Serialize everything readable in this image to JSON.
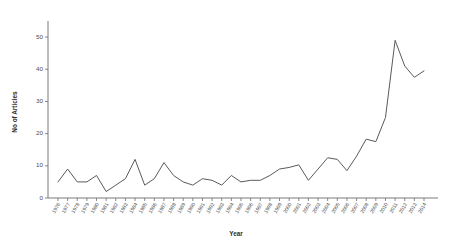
{
  "chart_data": {
    "type": "line",
    "title": "",
    "xlabel": "Year",
    "ylabel": "No of Articles",
    "ylim": [
      0,
      55
    ],
    "yticks": [
      0,
      10,
      20,
      30,
      40,
      50
    ],
    "grid": false,
    "legend": "none",
    "categories": [
      "1976",
      "1977",
      "1978",
      "1979",
      "1980",
      "1981",
      "1982",
      "1983",
      "1984",
      "1985",
      "1986",
      "1987",
      "1988",
      "1989",
      "1990",
      "1991",
      "1992",
      "1993",
      "1994",
      "1995",
      "1996",
      "1997",
      "1998",
      "1999",
      "2000",
      "2001",
      "2002",
      "2003",
      "2004",
      "2005",
      "2006",
      "2007",
      "2008",
      "2009",
      "2010",
      "2011",
      "2012",
      "2013",
      "2014"
    ],
    "series": [
      {
        "name": "No of Articles",
        "values": [
          5,
          9,
          5,
          5,
          7,
          2,
          4,
          6,
          12,
          4,
          6,
          11,
          7,
          5,
          4,
          6,
          5.5,
          4,
          7,
          5,
          5.5,
          5.5,
          7,
          9,
          9.5,
          10.3,
          5.5,
          9,
          12.5,
          12,
          8.5,
          13,
          18.3,
          17.5,
          25,
          49,
          41,
          37.5,
          39.5
        ]
      }
    ]
  },
  "axis": {
    "y_tick_labels": [
      "0",
      "10",
      "20",
      "30",
      "40",
      "50"
    ],
    "y_title": "No of Articles",
    "x_title": "Year"
  }
}
